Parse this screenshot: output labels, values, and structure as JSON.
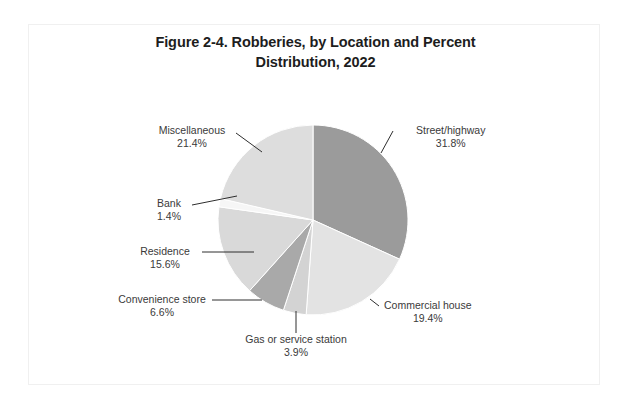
{
  "figure": {
    "title_line1": "Figure 2-4. Robberies, by Location and Percent",
    "title_line2": "Distribution, 2022"
  },
  "chart_data": {
    "type": "pie",
    "title": "Figure 2-4. Robberies, by Location and Percent Distribution, 2022",
    "xlabel": "",
    "ylabel": "",
    "grid": false,
    "legend_position": "none",
    "label_style": "external-with-leader-lines",
    "start_angle_deg": 0,
    "direction": "clockwise",
    "units": "percent",
    "categories": [
      "Street/highway",
      "Commercial house",
      "Gas or service station",
      "Convenience store",
      "Residence",
      "Bank",
      "Miscellaneous"
    ],
    "values": [
      31.8,
      19.4,
      3.9,
      6.6,
      15.6,
      1.4,
      21.4
    ],
    "value_labels": [
      "31.8%",
      "19.4%",
      "3.9%",
      "6.6%",
      "15.6%",
      "1.4%",
      "21.4%"
    ],
    "colors": [
      "#9b9b9b",
      "#e3e3e3",
      "#d3d3d3",
      "#a9a9a9",
      "#d9d9d9",
      "#f6f6f6",
      "#dddddd"
    ],
    "slices": [
      {
        "label": "Street/highway",
        "value": 31.8,
        "value_label": "31.8%",
        "color": "#9b9b9b"
      },
      {
        "label": "Commercial house",
        "value": 19.4,
        "value_label": "19.4%",
        "color": "#e3e3e3"
      },
      {
        "label": "Gas or service station",
        "value": 3.9,
        "value_label": "3.9%",
        "color": "#d3d3d3"
      },
      {
        "label": "Convenience store",
        "value": 6.6,
        "value_label": "6.6%",
        "color": "#a9a9a9"
      },
      {
        "label": "Residence",
        "value": 15.6,
        "value_label": "15.6%",
        "color": "#d9d9d9"
      },
      {
        "label": "Bank",
        "value": 1.4,
        "value_label": "1.4%",
        "color": "#f6f6f6"
      },
      {
        "label": "Miscellaneous",
        "value": 21.4,
        "value_label": "21.4%",
        "color": "#dddddd"
      }
    ]
  }
}
